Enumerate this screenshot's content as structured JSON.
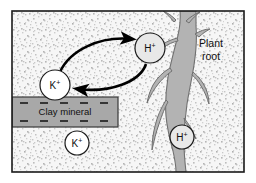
{
  "diagram": {
    "title_visible": false,
    "frame": {
      "border_color": "#1a1a1a",
      "background_color": "#f2f2f2"
    },
    "soil": {
      "name": "soil-matrix",
      "texture": "speckled",
      "base_color": "#f4f4f4",
      "speckle_color": "#b8b8b8"
    },
    "root": {
      "label_line1": "Plant",
      "label_line2": "root",
      "fill_color": "#b3b3b3",
      "outline_color": "#6e6e6e"
    },
    "clay": {
      "label": "Clay mineral",
      "fill_color": "#a8a8a8",
      "outline_color": "#3a3a3a",
      "charge_symbol": "–",
      "charges_top": [
        "–",
        "–",
        "–",
        "–",
        "–"
      ],
      "charges_bottom": [
        "–",
        "–",
        "–",
        "–",
        "–"
      ]
    },
    "ions": [
      {
        "id": "k-exchange",
        "element": "K",
        "charge": "+",
        "fill": "#ffffff",
        "cx": 55,
        "cy": 85,
        "r": 15
      },
      {
        "id": "h-exchange",
        "element": "H",
        "charge": "+",
        "fill": "#e8e8e8",
        "cx": 150,
        "cy": 48,
        "r": 15
      },
      {
        "id": "k-solution",
        "element": "K",
        "charge": "+",
        "fill": "#ffffff",
        "cx": 77,
        "cy": 143,
        "r": 12
      },
      {
        "id": "h-solution",
        "element": "H",
        "charge": "+",
        "fill": "#e8e8e8",
        "cx": 182,
        "cy": 137,
        "r": 12
      }
    ],
    "arrows": [
      {
        "id": "arrow-k-to-root",
        "direction": "left-to-right",
        "color": "#000000"
      },
      {
        "id": "arrow-h-to-clay",
        "direction": "right-to-left",
        "color": "#000000"
      }
    ]
  }
}
